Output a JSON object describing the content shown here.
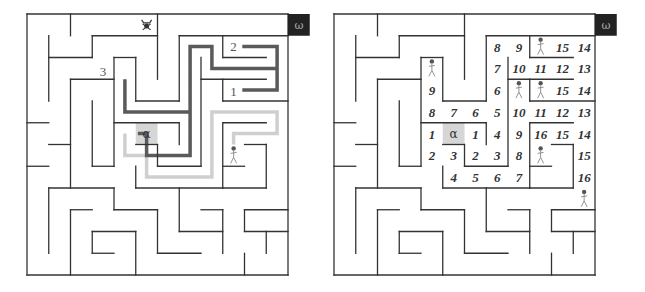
{
  "figure": {
    "grid_size": 12,
    "start_symbol": "α",
    "goal_symbol": "ω",
    "colors": {
      "wall": "#333333",
      "path_dark": "#5a5a5a",
      "path_light": "#cfcfcf",
      "start_cell": "#d6d6d6",
      "goal_box": "#222222"
    }
  },
  "left_panel": {
    "labels": [
      {
        "text": "3",
        "col": 3.35,
        "row": 2.85
      },
      {
        "text": "2",
        "col": 9.35,
        "row": 1.7
      },
      {
        "text": "1",
        "col": 9.35,
        "row": 3.75
      }
    ],
    "start": {
      "text": "α",
      "col": 5,
      "row": 5
    },
    "goal": {
      "text": "ω"
    },
    "skull_icon": {
      "col": 5.5,
      "row": 0.5
    },
    "walker": {
      "col": 9.5,
      "row": 6.5
    },
    "path_dark": "M 5.1 5.5 L 5.5 5.5 L 5.5 6.5 L 7.5 6.5 L 7.5 1.5 L 8.5 1.5 L 8.5 2.5 L 11.5 2.5 M 9.9 1.5 L 11.5 1.5 L 11.5 3.5 L 9.9 3.5 M 4.5 3 L 4.5 4.5 L 7.5 4.5",
    "path_light": "M 4.5 5.5 L 4.5 6.5 L 5.5 6.5 L 5.5 7.5 L 8.5 7.5 L 8.5 4.5 L 11.5 4.5 L 11.5 5.5 L 9.5 5.5 L 9.5 6"
  },
  "right_panel": {
    "start": {
      "text": "α",
      "col": 5,
      "row": 5
    },
    "goal": {
      "text": "ω"
    },
    "numbers": [
      {
        "text": "8",
        "col": 7,
        "row": 1
      },
      {
        "text": "9",
        "col": 8,
        "row": 1
      },
      {
        "text": "15",
        "col": 10,
        "row": 1
      },
      {
        "text": "14",
        "col": 11,
        "row": 1
      },
      {
        "text": "7",
        "col": 7,
        "row": 2
      },
      {
        "text": "10",
        "col": 8,
        "row": 2
      },
      {
        "text": "11",
        "col": 9,
        "row": 2
      },
      {
        "text": "12",
        "col": 10,
        "row": 2
      },
      {
        "text": "13",
        "col": 11,
        "row": 2
      },
      {
        "text": "9",
        "col": 4,
        "row": 3
      },
      {
        "text": "6",
        "col": 7,
        "row": 3
      },
      {
        "text": "15",
        "col": 10,
        "row": 3
      },
      {
        "text": "14",
        "col": 11,
        "row": 3
      },
      {
        "text": "8",
        "col": 4,
        "row": 4
      },
      {
        "text": "7",
        "col": 5,
        "row": 4
      },
      {
        "text": "6",
        "col": 6,
        "row": 4
      },
      {
        "text": "5",
        "col": 7,
        "row": 4
      },
      {
        "text": "10",
        "col": 8,
        "row": 4
      },
      {
        "text": "11",
        "col": 9,
        "row": 4
      },
      {
        "text": "12",
        "col": 10,
        "row": 4
      },
      {
        "text": "13",
        "col": 11,
        "row": 4
      },
      {
        "text": "1",
        "col": 4,
        "row": 5
      },
      {
        "text": "1",
        "col": 6,
        "row": 5
      },
      {
        "text": "4",
        "col": 7,
        "row": 5
      },
      {
        "text": "9",
        "col": 8,
        "row": 5
      },
      {
        "text": "16",
        "col": 9,
        "row": 5
      },
      {
        "text": "15",
        "col": 10,
        "row": 5
      },
      {
        "text": "14",
        "col": 11,
        "row": 5
      },
      {
        "text": "2",
        "col": 4,
        "row": 6
      },
      {
        "text": "3",
        "col": 5,
        "row": 6
      },
      {
        "text": "2",
        "col": 6,
        "row": 6
      },
      {
        "text": "3",
        "col": 7,
        "row": 6
      },
      {
        "text": "8",
        "col": 8,
        "row": 6
      },
      {
        "text": "15",
        "col": 11,
        "row": 6
      },
      {
        "text": "4",
        "col": 5,
        "row": 7
      },
      {
        "text": "5",
        "col": 6,
        "row": 7
      },
      {
        "text": "6",
        "col": 7,
        "row": 7
      },
      {
        "text": "7",
        "col": 8,
        "row": 7
      },
      {
        "text": "16",
        "col": 11,
        "row": 7
      }
    ],
    "walkers": [
      {
        "col": 4,
        "row": 2
      },
      {
        "col": 9,
        "row": 1
      },
      {
        "col": 8,
        "row": 3
      },
      {
        "col": 9,
        "row": 3
      },
      {
        "col": 9,
        "row": 6
      },
      {
        "col": 11,
        "row": 8
      }
    ]
  },
  "walls": [
    [
      0,
      0,
      12,
      0
    ],
    [
      0,
      0,
      0,
      12
    ],
    [
      0,
      12,
      12,
      12
    ],
    [
      12,
      0,
      12,
      12
    ],
    [
      2,
      0,
      2,
      1
    ],
    [
      1,
      1,
      1,
      4
    ],
    [
      1,
      2,
      3,
      2
    ],
    [
      3,
      1,
      3,
      2
    ],
    [
      3,
      1,
      6,
      1
    ],
    [
      6,
      0,
      6,
      3
    ],
    [
      7,
      1,
      12,
      1
    ],
    [
      7,
      1,
      7,
      4
    ],
    [
      5,
      4,
      7,
      4
    ],
    [
      5,
      2,
      5,
      4
    ],
    [
      4,
      2,
      5,
      2
    ],
    [
      4,
      2,
      4,
      7
    ],
    [
      2,
      3,
      4,
      3
    ],
    [
      2,
      3,
      2,
      8
    ],
    [
      3,
      4,
      3,
      7
    ],
    [
      3,
      7,
      4,
      7
    ],
    [
      0,
      5,
      1,
      5
    ],
    [
      1,
      6,
      2,
      6
    ],
    [
      0,
      7,
      1,
      7
    ],
    [
      9,
      1,
      9,
      2
    ],
    [
      9,
      2,
      11,
      2
    ],
    [
      8,
      2,
      8,
      7
    ],
    [
      8,
      3,
      11,
      3
    ],
    [
      9,
      3,
      9,
      4
    ],
    [
      9,
      4,
      12,
      4
    ],
    [
      4,
      5,
      7,
      5
    ],
    [
      7,
      5,
      7,
      6
    ],
    [
      5,
      6,
      6,
      6
    ],
    [
      6,
      6,
      6,
      7
    ],
    [
      6,
      7,
      8,
      7
    ],
    [
      5,
      7,
      5,
      8
    ],
    [
      5,
      8,
      9,
      8
    ],
    [
      9,
      5,
      11,
      5
    ],
    [
      9,
      5,
      9,
      8
    ],
    [
      9,
      8,
      11,
      8
    ],
    [
      11,
      6,
      11,
      8
    ],
    [
      10,
      6,
      11,
      6
    ],
    [
      9,
      7,
      10,
      7
    ],
    [
      1,
      8,
      4,
      8
    ],
    [
      1,
      8,
      1,
      11
    ],
    [
      4,
      8,
      4,
      9
    ],
    [
      4,
      9,
      6,
      9
    ],
    [
      6,
      9,
      6,
      11
    ],
    [
      6,
      11,
      8,
      11
    ],
    [
      2,
      9,
      3,
      9
    ],
    [
      2,
      9,
      2,
      12
    ],
    [
      3,
      10,
      5,
      10
    ],
    [
      3,
      10,
      3,
      11
    ],
    [
      3,
      11,
      4,
      11
    ],
    [
      5,
      10,
      5,
      12
    ],
    [
      7,
      8,
      7,
      10
    ],
    [
      7,
      10,
      9,
      10
    ],
    [
      9,
      9,
      9,
      11
    ],
    [
      8,
      9,
      9,
      9
    ],
    [
      10,
      9,
      10,
      10
    ],
    [
      10,
      9,
      12,
      9
    ],
    [
      10,
      10,
      12,
      10
    ],
    [
      11,
      10,
      11,
      11
    ],
    [
      10,
      11,
      10,
      12
    ]
  ]
}
